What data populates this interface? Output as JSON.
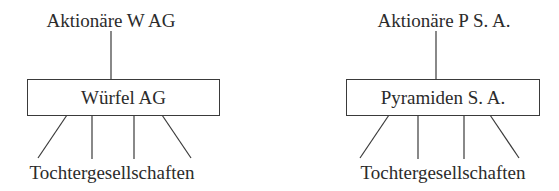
{
  "diagram": {
    "left": {
      "shareholders": "Aktionäre W AG",
      "company": "Würfel AG",
      "subsidiaries": "Tochtergesellschaften"
    },
    "right": {
      "shareholders": "Aktionäre P S. A.",
      "company": "Pyramiden S. A.",
      "subsidiaries": "Tochtergesellschaften"
    },
    "colors": {
      "line": "#3a3a3a",
      "text": "#2b2b2b",
      "background": "#ffffff"
    }
  }
}
